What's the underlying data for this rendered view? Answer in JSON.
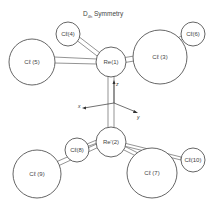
{
  "title": {
    "main": "D",
    "subscript": "4h",
    "rest": " Symmetry"
  },
  "atoms": {
    "cl4": "Cℓ(4)",
    "cl5": "Cℓ (5)",
    "re1": "Re(1)",
    "cl3": "Cℓ (3)",
    "cl6": "Cℓ(6)",
    "re2": "Re'(2)",
    "cl8": "Cℓ(8)",
    "cl9": "Cℓ (9)",
    "cl7": "Cℓ (7)",
    "cl10": "Cℓ(10)"
  },
  "axes": {
    "x": "x",
    "y": "y",
    "z": "z"
  }
}
